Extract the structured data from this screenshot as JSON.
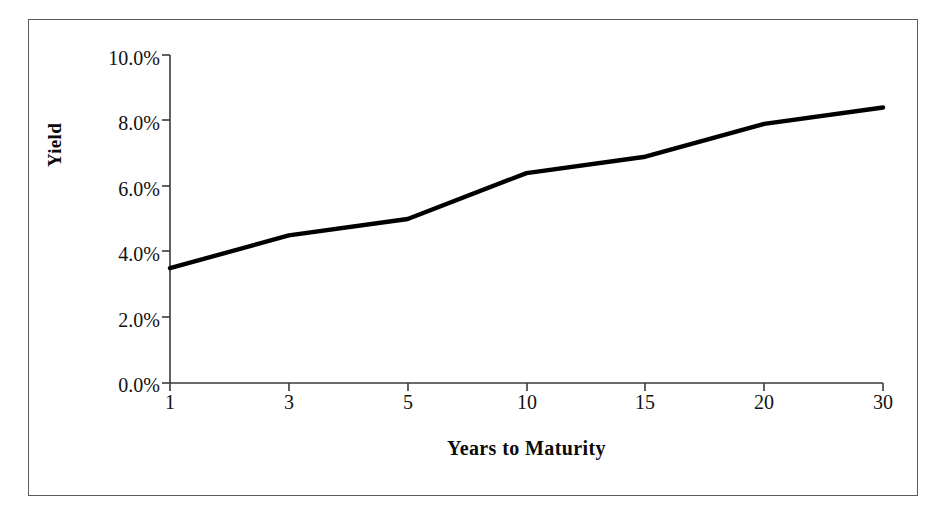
{
  "chart_data": {
    "type": "line",
    "title": "",
    "xlabel": "Years to Maturity",
    "ylabel": "Yield",
    "categories": [
      "1",
      "3",
      "5",
      "10",
      "15",
      "20",
      "30"
    ],
    "values": [
      3.5,
      4.5,
      5.0,
      6.4,
      6.9,
      7.9,
      8.4
    ],
    "value_suffix": "%",
    "ylim": [
      0.0,
      10.0
    ],
    "y_ticks": [
      0.0,
      2.0,
      4.0,
      6.0,
      8.0,
      10.0
    ],
    "y_tick_labels": [
      "0.0%",
      "2.0%",
      "4.0%",
      "6.0%",
      "8.0%",
      "10.0%"
    ],
    "x_tick_labels": [
      "1",
      "3",
      "5",
      "10",
      "15",
      "20",
      "30"
    ],
    "grid": false,
    "legend": false,
    "legend_position": "none",
    "series": [
      {
        "name": "Yield Curve",
        "color": "#000000",
        "line_width": 4,
        "values": [
          3.5,
          4.5,
          5.0,
          6.4,
          6.9,
          7.9,
          8.4
        ]
      }
    ],
    "axis_color": "#3a3a3a",
    "plot_background": "#ffffff",
    "figure_border_color": "#5b5b5b"
  },
  "axes": {
    "y_title": "Yield",
    "x_title": "Years to Maturity",
    "y_labels": [
      "10.0%",
      "8.0%",
      "6.0%",
      "4.0%",
      "2.0%",
      "0.0%"
    ],
    "x_labels": [
      "1",
      "3",
      "5",
      "10",
      "15",
      "20",
      "30"
    ]
  }
}
